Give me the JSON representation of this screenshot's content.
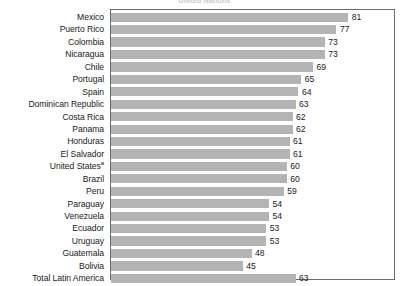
{
  "title": "United Nations",
  "colors": {
    "bar": "#b4b4b4",
    "frame": "#6d6d6d",
    "text": "#1a1a1a",
    "title": "#c9c9c9",
    "background": "#ffffff"
  },
  "chart_data": {
    "type": "bar",
    "orientation": "horizontal",
    "title": "United Nations",
    "xlabel": "",
    "ylabel": "",
    "xlim": [
      0,
      97
    ],
    "grid": false,
    "legend": null,
    "categories": [
      "Mexico",
      "Puerto Rico",
      "Colombia",
      "Nicaragua",
      "Chile",
      "Portugal",
      "Spain",
      "Dominican Republic",
      "Costa Rica",
      "Panama",
      "Honduras",
      "El Salvador",
      "United States",
      "Brazil",
      "Peru",
      "Paraguay",
      "Venezuela",
      "Ecuador",
      "Uruguay",
      "Guatemala",
      "Bolivia",
      "Total Latin America"
    ],
    "values": [
      81,
      77,
      73,
      73,
      69,
      65,
      64,
      63,
      62,
      62,
      61,
      61,
      60,
      60,
      59,
      54,
      54,
      53,
      53,
      48,
      45,
      63
    ],
    "footnote_markers": {
      "United States": "a"
    }
  },
  "rows": [
    {
      "label": "Mexico",
      "marker": "",
      "value": 81
    },
    {
      "label": "Puerto Rico",
      "marker": "",
      "value": 77
    },
    {
      "label": "Colombia",
      "marker": "",
      "value": 73
    },
    {
      "label": "Nicaragua",
      "marker": "",
      "value": 73
    },
    {
      "label": "Chile",
      "marker": "",
      "value": 69
    },
    {
      "label": "Portugal",
      "marker": "",
      "value": 65
    },
    {
      "label": "Spain",
      "marker": "",
      "value": 64
    },
    {
      "label": "Dominican Republic",
      "marker": "",
      "value": 63
    },
    {
      "label": "Costa Rica",
      "marker": "",
      "value": 62
    },
    {
      "label": "Panama",
      "marker": "",
      "value": 62
    },
    {
      "label": "Honduras",
      "marker": "",
      "value": 61
    },
    {
      "label": "El Salvador",
      "marker": "",
      "value": 61
    },
    {
      "label": "United States",
      "marker": "a",
      "value": 60
    },
    {
      "label": "Brazil",
      "marker": "",
      "value": 60
    },
    {
      "label": "Peru",
      "marker": "",
      "value": 59
    },
    {
      "label": "Paraguay",
      "marker": "",
      "value": 54
    },
    {
      "label": "Venezuela",
      "marker": "",
      "value": 54
    },
    {
      "label": "Ecuador",
      "marker": "",
      "value": 53
    },
    {
      "label": "Uruguay",
      "marker": "",
      "value": 53
    },
    {
      "label": "Guatemala",
      "marker": "",
      "value": 48
    },
    {
      "label": "Bolivia",
      "marker": "",
      "value": 45
    },
    {
      "label": "Total Latin America",
      "marker": "",
      "value": 63
    }
  ]
}
